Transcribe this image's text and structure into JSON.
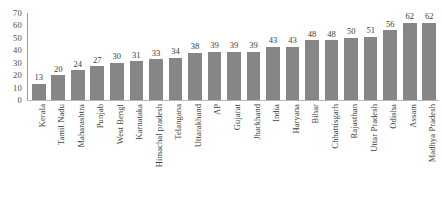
{
  "chart_data": {
    "type": "bar",
    "title": "",
    "subtitle": "",
    "xlabel": "",
    "ylabel": "",
    "ylim": [
      0,
      70
    ],
    "yticks": [
      70,
      60,
      50,
      40,
      30,
      20,
      10,
      0
    ],
    "grid": false,
    "legend": null,
    "bar_color": "#868686",
    "categories": [
      "Kerala",
      "Tamil Nadu",
      "Maharashtra",
      "Punjab",
      "West Bengl",
      "Karnataka",
      "Himachal pradesh",
      "Telangana",
      "Uttarakhand",
      "AP",
      "Gujarat",
      "Jharkhand",
      "India",
      "Haryana",
      "Bihar",
      "Chhattisgarh",
      "Rajasthan",
      "Uttar Pradesh",
      "Odisha",
      "Assam",
      "Madhya Pradesh"
    ],
    "values": [
      13,
      20,
      24,
      27,
      30,
      31,
      33,
      34,
      38,
      39,
      39,
      39,
      43,
      43,
      48,
      48,
      50,
      51,
      56,
      62,
      62
    ],
    "value_labels": [
      "13",
      "20",
      "24",
      "27",
      "30",
      "31",
      "33",
      "34",
      "38",
      "39",
      "39",
      "39",
      "43",
      "43",
      "48",
      "48",
      "50",
      "51",
      "56",
      "62",
      "62"
    ]
  }
}
